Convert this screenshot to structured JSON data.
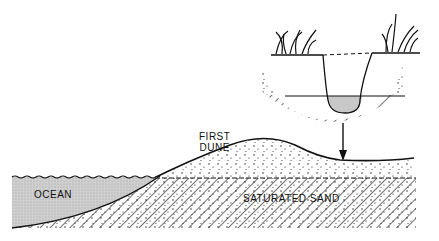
{
  "diagram": {
    "labels": {
      "first_dune_line1": "FIRST",
      "first_dune_line2": "DUNE",
      "ocean": "OCEAN",
      "saturated_sand": "SATURATED SAND"
    },
    "elements": [
      "ocean",
      "first dune",
      "saturated sand layer",
      "water table",
      "arrow to swale",
      "inset: dug pit with water at water table",
      "grass tufts"
    ],
    "colors": {
      "ink": "#111111",
      "water": "#c8c8c8",
      "background": "#ffffff"
    }
  }
}
